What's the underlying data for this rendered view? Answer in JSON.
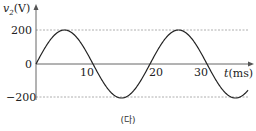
{
  "chart_data": {
    "type": "line",
    "title": "",
    "xlabel": "t(ms)",
    "ylabel": "v2(V)",
    "ylabel_display": {
      "var": "v",
      "sub": "2",
      "unit": "(V)"
    },
    "xlabel_display": {
      "var": "t",
      "unit": "(ms)"
    },
    "x_ticks": [
      "10",
      "20",
      "30"
    ],
    "y_ticks": [
      "200",
      "0",
      "−200"
    ],
    "ylim": [
      -200,
      200
    ],
    "xlim": [
      0,
      37
    ],
    "grid": "dashed horizontal reference lines at ±200",
    "series": [
      {
        "name": "v2",
        "function": "200*sin(2*pi*t/20)",
        "amplitude": 200,
        "period_ms": 20,
        "x": [
          0,
          5,
          10,
          15,
          20,
          25,
          30,
          35,
          37
        ],
        "values": [
          0,
          200,
          0,
          -200,
          0,
          200,
          0,
          -200,
          -162
        ]
      }
    ],
    "caption": "(다)"
  },
  "colors": {
    "curve": "#222222",
    "axis": "#555555",
    "refline": "#9a9a9a"
  }
}
